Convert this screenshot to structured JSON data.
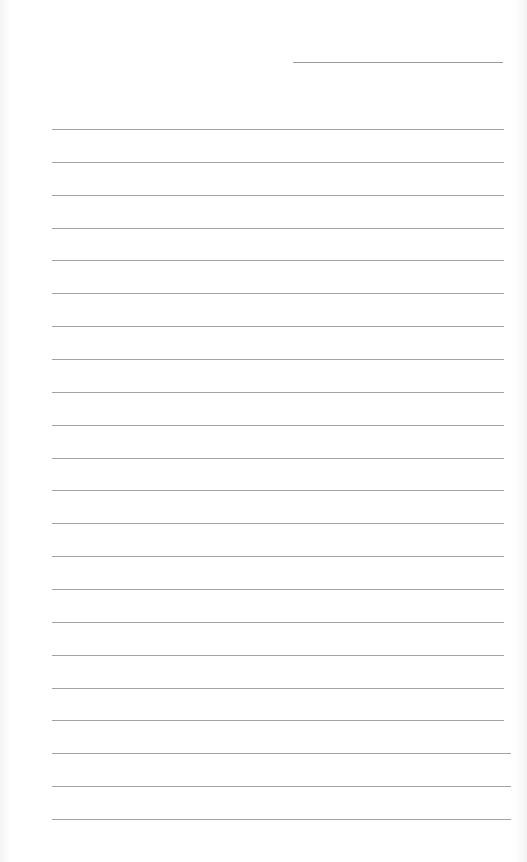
{
  "page": {
    "type": "ruled-notebook-page",
    "background_color": "#ffffff",
    "line_color": "#a3a3a3"
  },
  "header": {
    "title_line_text": ""
  },
  "ruled_lines": {
    "count": 22,
    "first_y": 129,
    "spacing": 32.86,
    "rows": [
      "",
      "",
      "",
      "",
      "",
      "",
      "",
      "",
      "",
      "",
      "",
      "",
      "",
      "",
      "",
      "",
      "",
      "",
      "",
      "",
      "",
      ""
    ]
  }
}
